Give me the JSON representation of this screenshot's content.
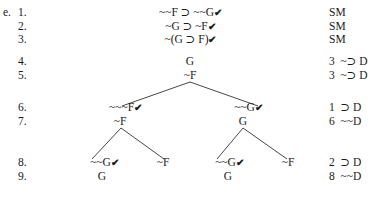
{
  "exercise_label": "e.",
  "rows": [
    {
      "num": "1.",
      "formula": "~~F ⊃ ~~G",
      "checked": true,
      "justification": "SM"
    },
    {
      "num": "2.",
      "formula": "~G ⊃ ~F",
      "checked": true,
      "justification": "SM"
    },
    {
      "num": "3.",
      "formula": "~(G ⊃ F)",
      "checked": true,
      "justification": "SM"
    },
    {
      "num": "4.",
      "formula": "G",
      "checked": false,
      "justification": "3  ~⊃ D"
    },
    {
      "num": "5.",
      "formula": "~F",
      "checked": false,
      "justification": "3  ~⊃ D"
    },
    {
      "num": "6.",
      "justification": "1  ⊃ D"
    },
    {
      "num": "7.",
      "justification": "6  ~~D"
    },
    {
      "num": "8.",
      "justification": "2  ⊃ D"
    },
    {
      "num": "9.",
      "justification": "8  ~~D"
    }
  ],
  "tree": {
    "row6": {
      "left": "~~~F",
      "left_checked": true,
      "right": "~~G",
      "right_checked": true
    },
    "row7": {
      "left": "~F",
      "right": "G"
    },
    "row8": {
      "ll": "~~G",
      "ll_checked": true,
      "lr": "~F",
      "rl": "~~G",
      "rl_checked": true,
      "rr": "~F"
    },
    "row9": {
      "ll": "G",
      "rl": "G"
    }
  },
  "check_mark": "✔"
}
